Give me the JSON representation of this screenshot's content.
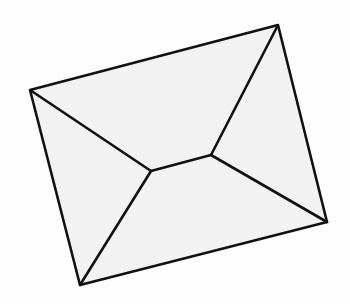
{
  "image": {
    "subject": "hand-drawn envelope sketch",
    "background": "#fdfdfd",
    "fill": "#f2f2f2",
    "stroke": "#111111",
    "points": {
      "top_left": [
        30,
        90
      ],
      "top_right": [
        278,
        25
      ],
      "bottom_right": [
        327,
        222
      ],
      "bottom_left": [
        80,
        285
      ],
      "inner_left": [
        151,
        171
      ],
      "inner_right": [
        211,
        155
      ]
    }
  }
}
